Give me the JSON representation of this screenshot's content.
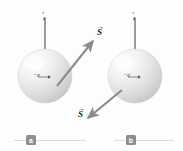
{
  "figure": {
    "background_color": "#fdfdfd",
    "sphere_color": "#e8e8e8",
    "vector_color": "#8c8c8c",
    "axis_color": "#4a4a4a",
    "tag_color": "#8e8e8e"
  },
  "panels": [
    {
      "tag": "a",
      "axis_label": "z",
      "axis_bar": "↑",
      "charge_label": "−e",
      "spin_label": "S",
      "spin_bar": "→",
      "spin_direction": "up-right"
    },
    {
      "tag": "b",
      "axis_label": "z",
      "axis_bar": "↑",
      "charge_label": "−e",
      "spin_label": "S",
      "spin_bar": "→",
      "spin_direction": "down-left"
    }
  ]
}
